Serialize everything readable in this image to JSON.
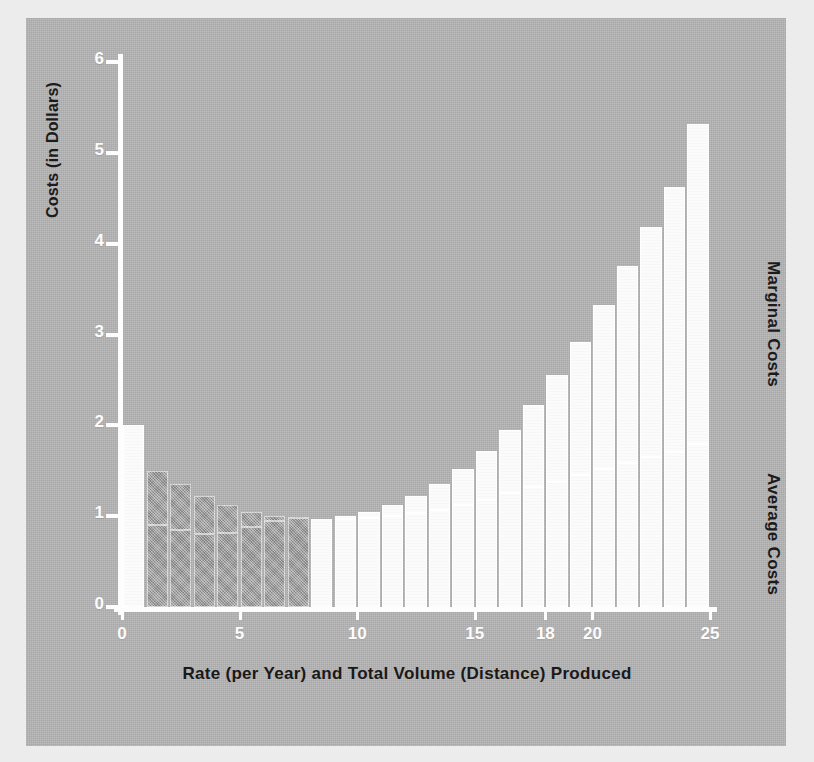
{
  "axes": {
    "y_title": "Costs (in Dollars)",
    "x_title": "Rate (per Year) and Total Volume (Distance) Produced",
    "y_ticks": [
      "0",
      "1",
      "2",
      "3",
      "4",
      "5",
      "6"
    ],
    "x_ticks": [
      "0",
      "5",
      "10",
      "15",
      "18",
      "20",
      "25"
    ]
  },
  "series_labels": {
    "marginal": "Marginal Costs",
    "average": "Average Costs"
  },
  "colors": {
    "panel": "#b4b4b4",
    "outer": "#ececec",
    "marginal_fill": "#fbfbfb",
    "average_fill": "#a3a3a3",
    "axis": "#fdfdfd",
    "title_text": "#191919",
    "tick_text": "#fcfcfc"
  },
  "chart_data": {
    "type": "bar",
    "title": "",
    "subtitle": "",
    "xlabel": "Rate (per Year) and Total Volume (Distance) Produced",
    "ylabel": "Costs (in Dollars)",
    "xlim": [
      0,
      25
    ],
    "ylim": [
      0,
      6
    ],
    "grid": false,
    "legend_position": "right-outside",
    "stacked_overlay": true,
    "note": "Each bar spans one unit of output. Bar top = Marginal Cost, inner step = Average Cost. Before x~8 marginal lies below average (white cap sits on dark average block); after the crossover marginal exceeds average (dark average block sits below white marginal cap).",
    "categories": [
      "0-1",
      "1-2",
      "2-3",
      "3-4",
      "4-5",
      "5-6",
      "6-7",
      "7-8",
      "8-9",
      "9-10",
      "10-11",
      "11-12",
      "12-13",
      "13-14",
      "14-15",
      "15-16",
      "16-17",
      "17-18",
      "18-19",
      "19-20",
      "20-21",
      "21-22",
      "22-23",
      "23-24",
      "24-25"
    ],
    "x": [
      1,
      2,
      3,
      4,
      5,
      6,
      7,
      8,
      9,
      10,
      11,
      12,
      13,
      14,
      15,
      16,
      17,
      18,
      19,
      20,
      21,
      22,
      23,
      24,
      25
    ],
    "series": [
      {
        "name": "Marginal Costs",
        "values": [
          2.0,
          0.9,
          0.85,
          0.8,
          0.82,
          0.88,
          0.95,
          0.98,
          0.97,
          1.0,
          1.05,
          1.12,
          1.22,
          1.35,
          1.52,
          1.72,
          1.95,
          2.22,
          2.55,
          2.92,
          3.32,
          3.75,
          4.18,
          4.62,
          5.32
        ]
      },
      {
        "name": "Average Costs",
        "values": [
          2.0,
          1.5,
          1.35,
          1.22,
          1.12,
          1.05,
          1.0,
          0.99,
          0.97,
          0.97,
          0.98,
          1.0,
          1.03,
          1.07,
          1.12,
          1.18,
          1.25,
          1.32,
          1.38,
          1.45,
          1.52,
          1.58,
          1.65,
          1.71,
          1.8
        ]
      }
    ]
  }
}
